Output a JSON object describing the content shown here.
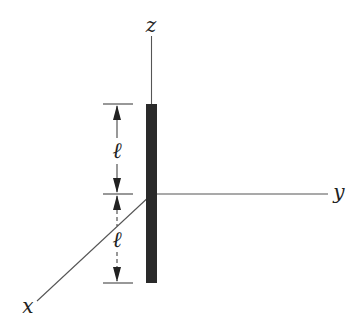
{
  "diagram": {
    "axes": {
      "z_label": "z",
      "y_label": "y",
      "x_label": "x"
    },
    "rod": {
      "color": "#2a2a2a",
      "top_half_label": "ℓ",
      "bottom_half_label": "ℓ"
    },
    "colors": {
      "axis": "#555555",
      "dimension": "#444444",
      "background": "#ffffff"
    }
  }
}
